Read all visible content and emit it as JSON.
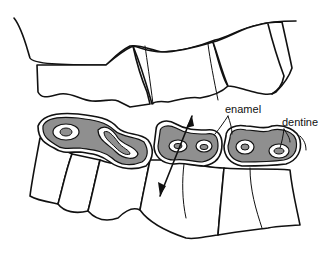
{
  "figure": {
    "labels": {
      "enamel": "enamel",
      "dentine": "dentine"
    },
    "colors": {
      "line": "#111111",
      "dentine_fill": "#8f8f8f",
      "enamel_fill": "#ffffff",
      "background": "#ffffff"
    },
    "annotations": [
      {
        "name": "enamel-pointer",
        "target": "enamel ridges",
        "count": 2
      },
      {
        "name": "dentine-pointer",
        "target": "dentine",
        "count": 1
      },
      {
        "name": "double-arrow",
        "meaning": "up-down chewing motion"
      }
    ]
  }
}
